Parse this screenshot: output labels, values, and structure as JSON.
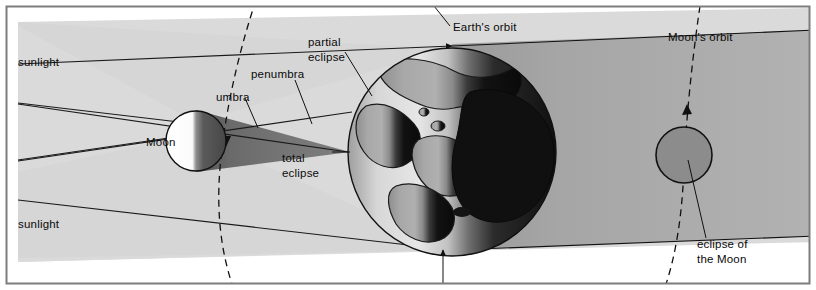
{
  "figure": {
    "kind": "astronomy-diagram",
    "width": 816,
    "height": 290
  },
  "labels": {
    "sunlight_top": "sunlight",
    "sunlight_bottom": "sunlight",
    "umbra": "umbra",
    "penumbra": "penumbra",
    "partial_eclipse_line1": "partial",
    "partial_eclipse_line2": "eclipse",
    "total_eclipse_line1": "total",
    "total_eclipse_line2": "eclipse",
    "moon": "Moon",
    "earths_orbit": "Earth's orbit",
    "moons_orbit": "Moon's orbit",
    "eclipse_of_moon_line1": "eclipse of",
    "eclipse_of_moon_line2": "the Moon"
  },
  "bodies": {
    "moon_near": {
      "name": "Moon",
      "lit_side": "left",
      "lit_color": "#ffffff",
      "dark_color": "#4a4a4a"
    },
    "earth": {
      "name": "Earth",
      "day_color": "#b4b4b4",
      "night_color": "#161616",
      "land_color": "#9a9a9a"
    },
    "moon_eclipsed": {
      "name": "eclipse of the Moon",
      "color": "#8c8c8c"
    }
  },
  "shadow_regions": {
    "sunlight_band": "#dcdcdc",
    "penumbra_band": "#d2d2d2",
    "umbra_cone": "#6e6e6e",
    "earth_shadow": "#a8a8a8",
    "orbit_band": "#ffffff"
  },
  "colors": {
    "outline": "#111111",
    "text": "#0a0a0a",
    "frame": "#8a8a8a",
    "page_background": "#ffffff"
  },
  "icons": {
    "sunlight_ray_arrow": "arrowhead-right",
    "orbit_direction_arrow": "arrowhead-down",
    "earth_pointer_arrow": "arrowhead-up"
  }
}
